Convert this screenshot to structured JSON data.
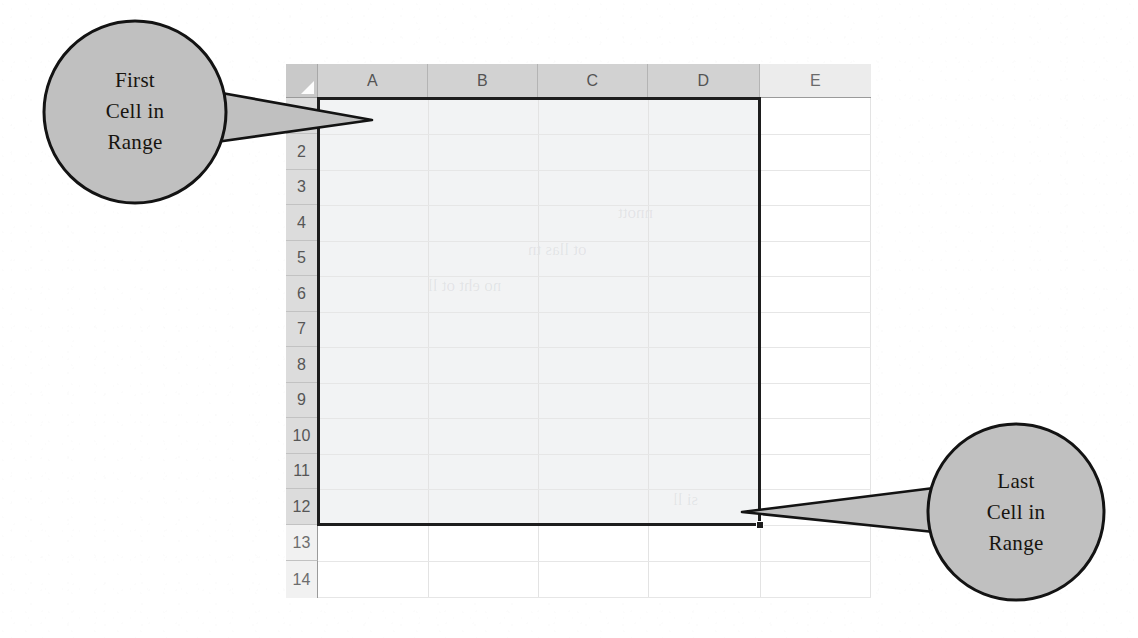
{
  "figure": {
    "kind": "spreadsheet-range-illustration",
    "background_color": "#ffffff"
  },
  "spreadsheet": {
    "select_all_corner": "select-all",
    "column_headers": [
      {
        "label": "A",
        "selected": true
      },
      {
        "label": "B",
        "selected": true
      },
      {
        "label": "C",
        "selected": true
      },
      {
        "label": "D",
        "selected": true
      },
      {
        "label": "E",
        "selected": false
      }
    ],
    "row_headers": [
      {
        "label": "1",
        "selected": true
      },
      {
        "label": "2",
        "selected": true
      },
      {
        "label": "3",
        "selected": true
      },
      {
        "label": "4",
        "selected": true
      },
      {
        "label": "5",
        "selected": true
      },
      {
        "label": "6",
        "selected": true
      },
      {
        "label": "7",
        "selected": true
      },
      {
        "label": "8",
        "selected": true
      },
      {
        "label": "9",
        "selected": true
      },
      {
        "label": "10",
        "selected": true
      },
      {
        "label": "11",
        "selected": true
      },
      {
        "label": "12",
        "selected": true
      },
      {
        "label": "13",
        "selected": false
      },
      {
        "label": "14",
        "selected": false
      }
    ],
    "selection": {
      "range": "A1:D12",
      "first_cell": "A1",
      "last_cell": "D12",
      "fill_color": "#f2f3f4",
      "border_color": "#1d1d1d",
      "handle": "fill-handle"
    },
    "colors": {
      "header_selected": "#d2d2d2",
      "header_unselected": "#ececec",
      "gridline": "#e3e3e3",
      "cell_background": "#ffffff"
    },
    "showthrough_lines": [
      "nnott",
      "ot llas tn",
      "no eht ot ll",
      "si ll"
    ]
  },
  "callouts": [
    {
      "id": "first-cell",
      "lines": [
        "First",
        "Cell in",
        "Range"
      ],
      "fill_color": "#c0c0c0",
      "stroke_color": "#131313",
      "tail_direction": "right",
      "points_at": "A1"
    },
    {
      "id": "last-cell",
      "lines": [
        "Last",
        "Cell in",
        "Range"
      ],
      "fill_color": "#c0c0c0",
      "stroke_color": "#131313",
      "tail_direction": "left",
      "points_at": "D12"
    }
  ]
}
